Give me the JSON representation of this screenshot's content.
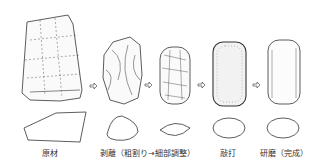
{
  "stages": [
    {
      "id": "raw",
      "label": "原材"
    },
    {
      "id": "flaking",
      "label": "剥離（粗割り→細部調整）"
    },
    {
      "id": "pecking",
      "label": "敲打"
    },
    {
      "id": "grinding",
      "label": "研磨（完成）"
    }
  ],
  "arrow_icon": "right-arrow-icon"
}
